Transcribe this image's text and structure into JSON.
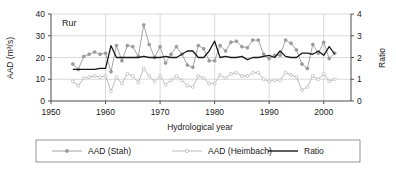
{
  "chart_data": {
    "type": "line",
    "title": "",
    "annotation": "Rur",
    "xlabel": "Hydrological year",
    "ylabel": "AAD (m³/s)",
    "y2label": "Ratio",
    "xlim": [
      1950,
      2005
    ],
    "ylim": [
      0,
      40
    ],
    "y2lim": [
      0,
      4
    ],
    "xticks": [
      1950,
      1960,
      1970,
      1980,
      1990,
      2000
    ],
    "yticks": [
      0,
      10,
      20,
      30,
      40
    ],
    "y2ticks": [
      0,
      1,
      2,
      3,
      4
    ],
    "grid": true,
    "legend_position": "bottom-outside",
    "x": [
      1954,
      1955,
      1956,
      1957,
      1958,
      1959,
      1960,
      1961,
      1962,
      1963,
      1964,
      1965,
      1966,
      1967,
      1968,
      1969,
      1970,
      1971,
      1972,
      1973,
      1974,
      1975,
      1976,
      1977,
      1978,
      1979,
      1980,
      1981,
      1982,
      1983,
      1984,
      1985,
      1986,
      1987,
      1988,
      1989,
      1990,
      1991,
      1992,
      1993,
      1994,
      1995,
      1996,
      1997,
      1998,
      1999,
      2000,
      2001,
      2002
    ],
    "series": [
      {
        "name": "AAD (Stah)",
        "color": "#9a9a9a",
        "marker": "filled-circle",
        "axis": "left",
        "values": [
          17.0,
          14.5,
          20.5,
          21.5,
          22.5,
          21.5,
          22.0,
          13.5,
          25.5,
          18.5,
          25.5,
          25.0,
          20.5,
          35.0,
          26.0,
          20.0,
          25.0,
          17.5,
          21.5,
          25.0,
          21.5,
          16.5,
          15.5,
          25.5,
          24.0,
          18.5,
          18.5,
          25.5,
          23.0,
          27.0,
          27.5,
          25.0,
          24.5,
          28.0,
          28.0,
          21.5,
          19.5,
          21.0,
          21.0,
          28.0,
          26.5,
          23.5,
          17.0,
          15.0,
          26.0,
          22.0,
          27.0,
          19.5,
          22.0
        ]
      },
      {
        "name": "AAD (Heimbach)",
        "color": "#b5b5b5",
        "marker": "open-circle",
        "axis": "left",
        "values": [
          9.0,
          7.0,
          10.5,
          11.0,
          11.5,
          11.0,
          11.5,
          4.5,
          11.0,
          8.0,
          12.5,
          11.5,
          8.5,
          15.0,
          11.5,
          9.0,
          11.5,
          7.5,
          9.5,
          11.5,
          9.5,
          7.0,
          6.5,
          11.5,
          10.5,
          8.0,
          8.0,
          12.0,
          10.5,
          12.5,
          13.0,
          11.5,
          11.5,
          13.0,
          13.0,
          10.0,
          9.0,
          9.5,
          9.5,
          13.0,
          12.0,
          11.0,
          5.0,
          6.5,
          11.5,
          10.0,
          12.5,
          9.0,
          10.0
        ]
      },
      {
        "name": "Ratio",
        "color": "#1a1a1a",
        "marker": "none",
        "axis": "right",
        "values": [
          1.45,
          1.45,
          1.45,
          1.45,
          1.45,
          1.5,
          1.5,
          2.55,
          2.0,
          2.0,
          2.0,
          2.0,
          2.0,
          2.05,
          2.0,
          2.0,
          2.0,
          2.05,
          2.0,
          2.0,
          2.15,
          2.3,
          2.3,
          2.0,
          2.0,
          2.3,
          2.75,
          2.0,
          2.05,
          2.0,
          2.0,
          2.05,
          1.9,
          2.0,
          2.0,
          2.05,
          2.1,
          2.0,
          2.3,
          2.05,
          2.0,
          2.0,
          2.2,
          2.2,
          2.15,
          2.3,
          2.1,
          2.5,
          2.15
        ]
      }
    ]
  },
  "legend": {
    "items": [
      {
        "label": "AAD (Stah)"
      },
      {
        "label": "AAD (Heimbach)"
      },
      {
        "label": "Ratio"
      }
    ]
  }
}
